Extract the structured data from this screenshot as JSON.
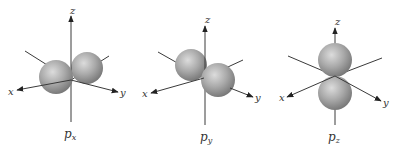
{
  "figure": {
    "panels": [
      {
        "id": "px",
        "caption": "p",
        "caption_sub": "x",
        "axes": {
          "x": "x",
          "y": "y",
          "z": "z"
        }
      },
      {
        "id": "py",
        "caption": "p",
        "caption_sub": "y",
        "axes": {
          "x": "x",
          "y": "y",
          "z": "z"
        }
      },
      {
        "id": "pz",
        "caption": "p",
        "caption_sub": "z",
        "axes": {
          "x": "x",
          "y": "y",
          "z": "z"
        }
      }
    ],
    "colors": {
      "lobe_light": "#d8d8d8",
      "lobe_mid": "#a6a6a6",
      "lobe_dark": "#7c7c7c",
      "axis": "#3a3a3a"
    }
  }
}
